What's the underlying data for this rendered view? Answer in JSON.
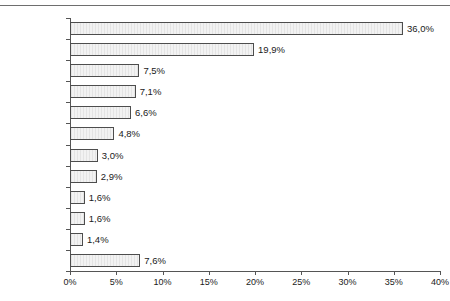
{
  "chart_data": {
    "type": "bar",
    "orientation": "horizontal",
    "title": "",
    "xlabel": "",
    "ylabel": "",
    "xlim": [
      0,
      40
    ],
    "grid": false,
    "legend": null,
    "value_suffix": "%",
    "decimal_separator": ",",
    "categories": [
      "Pop",
      "Rock",
      "Klassik",
      "Hörbücher",
      "Kinderprodukte",
      "Schlager",
      "Dance",
      "Deutschpop",
      "Volksmusik",
      "Hip Hop",
      "Jazz",
      "Sonstige"
    ],
    "values": [
      36.0,
      19.9,
      7.5,
      7.1,
      6.6,
      4.8,
      3.0,
      2.9,
      1.6,
      1.6,
      1.4,
      7.6
    ],
    "value_labels": [
      "36,0%",
      "19,9%",
      "7,5%",
      "7,1%",
      "6,6%",
      "4,8%",
      "3,0%",
      "2,9%",
      "1,6%",
      "1,6%",
      "1,4%",
      "7,6%"
    ],
    "xticks": [
      0,
      5,
      10,
      15,
      20,
      25,
      30,
      35,
      40
    ],
    "xtick_labels": [
      "0%",
      "5%",
      "10%",
      "15%",
      "20%",
      "25%",
      "30%",
      "35%",
      "40%"
    ],
    "colors": {
      "bar_fill": "#ebebeb",
      "bar_border": "#4d4d4d",
      "axis": "#555555",
      "text": "#1a1a1a",
      "top_rule": "#6e6e6e",
      "background": "#ffffff"
    }
  }
}
